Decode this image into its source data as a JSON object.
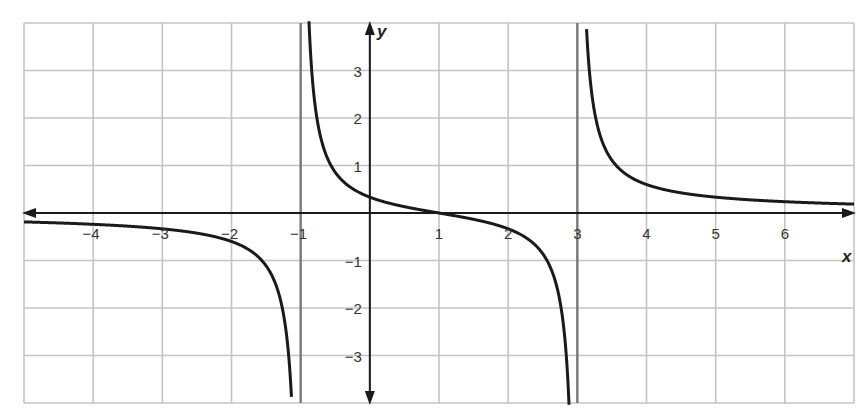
{
  "chart_data": {
    "type": "line",
    "title": "",
    "function": "f(x) = (x - 1) / ((x + 1)(x - 3))",
    "xlabel": "x",
    "ylabel": "y",
    "xlim": [
      -5,
      7
    ],
    "ylim": [
      -4,
      4
    ],
    "grid": true,
    "x_ticks": [
      -4,
      -3,
      -2,
      -1,
      1,
      2,
      3,
      4,
      5,
      6
    ],
    "x_tick_labels": [
      "−4",
      "−3",
      "−2",
      "−1",
      "1",
      "2",
      "3",
      "4",
      "5",
      "6"
    ],
    "y_ticks": [
      -3,
      -2,
      -1,
      1,
      2,
      3
    ],
    "y_tick_labels": [
      "−3",
      "−2",
      "−1",
      "1",
      "2",
      "3"
    ],
    "vertical_asymptotes": [
      -1,
      3
    ],
    "horizontal_asymptote": 0,
    "x_intercept": 1,
    "y_intercept": 0.333,
    "sample_points": [
      {
        "x": -5,
        "y": -0.19
      },
      {
        "x": -4,
        "y": -0.24
      },
      {
        "x": -3,
        "y": -0.33
      },
      {
        "x": -2,
        "y": -0.6
      },
      {
        "x": -1.5,
        "y": -1.11
      },
      {
        "x": -1.2,
        "y": -2.33
      },
      {
        "x": -0.8,
        "y": 2.37
      },
      {
        "x": -0.5,
        "y": 0.86
      },
      {
        "x": 0,
        "y": 0.33
      },
      {
        "x": 1,
        "y": 0
      },
      {
        "x": 2,
        "y": -0.33
      },
      {
        "x": 2.5,
        "y": -0.86
      },
      {
        "x": 2.8,
        "y": -2.37
      },
      {
        "x": 3.2,
        "y": 2.62
      },
      {
        "x": 3.5,
        "y": 1.11
      },
      {
        "x": 4,
        "y": 0.6
      },
      {
        "x": 5,
        "y": 0.33
      },
      {
        "x": 6,
        "y": 0.24
      },
      {
        "x": 7,
        "y": 0.19
      }
    ],
    "colors": {
      "curve": "#1a1a1a",
      "axes": "#1a1a1a",
      "grid": "#c4c4c4",
      "asymptote": "#7a7a7a"
    }
  }
}
